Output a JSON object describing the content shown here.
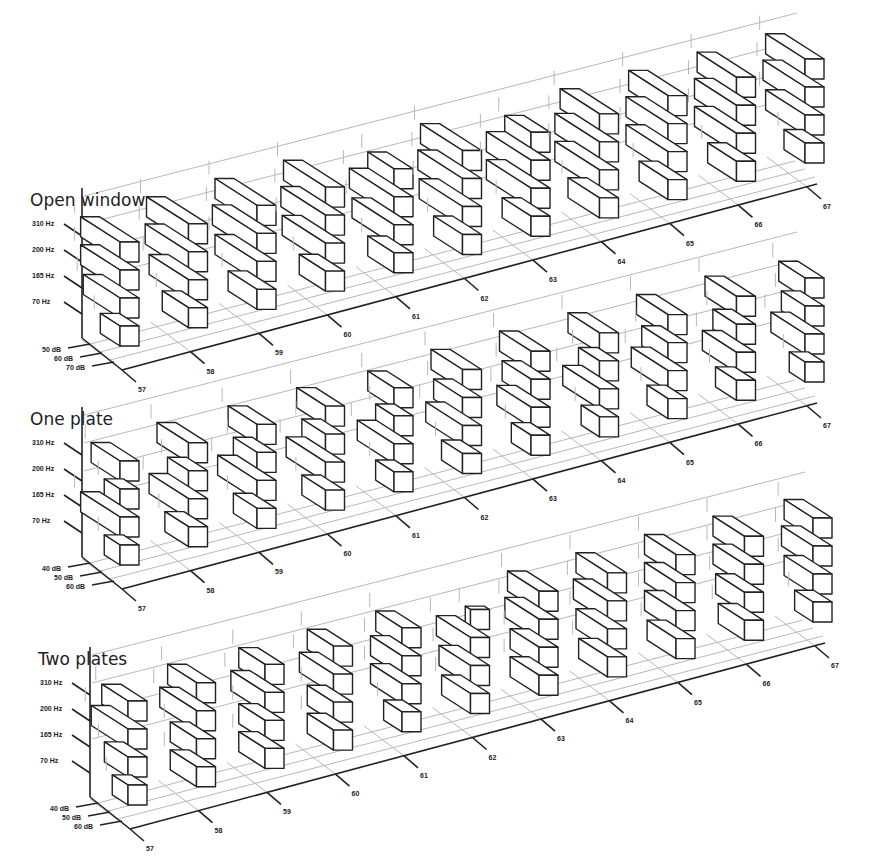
{
  "chart_data": [
    {
      "type": "bar3d",
      "title": "Open window",
      "categories": [
        "57",
        "58",
        "59",
        "60",
        "61",
        "62",
        "63",
        "64",
        "65",
        "66",
        "67"
      ],
      "frequencies": [
        "70 Hz",
        "165 Hz",
        "200 Hz",
        "310 Hz"
      ],
      "depth_axis_labels": [
        "50 dB",
        "60 dB",
        "70 dB"
      ],
      "series": [
        {
          "name": "70 Hz",
          "values": [
            45,
            50,
            52,
            50,
            50,
            52,
            52,
            54,
            52,
            52,
            46
          ]
        },
        {
          "name": "165 Hz",
          "values": [
            58,
            60,
            62,
            63,
            62,
            63,
            64,
            64,
            62,
            62,
            60
          ]
        },
        {
          "name": "200 Hz",
          "values": [
            60,
            63,
            64,
            64,
            64,
            64,
            64,
            64,
            62,
            62,
            62
          ]
        },
        {
          "name": "310 Hz",
          "values": [
            60,
            62,
            62,
            62,
            50,
            62,
            50,
            60,
            60,
            60,
            60
          ]
        }
      ]
    },
    {
      "type": "bar3d",
      "title": "One plate",
      "categories": [
        "57",
        "58",
        "59",
        "60",
        "61",
        "62",
        "63",
        "64",
        "65",
        "66",
        "67"
      ],
      "frequencies": [
        "70 Hz",
        "165 Hz",
        "200 Hz",
        "310 Hz"
      ],
      "depth_axis_labels": [
        "40 dB",
        "50 dB",
        "60 dB"
      ],
      "series": [
        {
          "name": "70 Hz",
          "values": [
            42,
            48,
            48,
            48,
            44,
            46,
            45,
            44,
            46,
            46,
            42
          ]
        },
        {
          "name": "165 Hz",
          "values": [
            60,
            60,
            60,
            60,
            58,
            58,
            56,
            58,
            58,
            56,
            56
          ]
        },
        {
          "name": "200 Hz",
          "values": [
            42,
            46,
            48,
            48,
            44,
            52,
            52,
            46,
            50,
            48,
            48
          ]
        },
        {
          "name": "310 Hz",
          "values": [
            52,
            54,
            52,
            52,
            50,
            54,
            54,
            54,
            54,
            54,
            50
          ]
        }
      ]
    },
    {
      "type": "bar3d",
      "title": "Two plates",
      "categories": [
        "57",
        "58",
        "59",
        "60",
        "61",
        "62",
        "63",
        "64",
        "65",
        "66",
        "67"
      ],
      "frequencies": [
        "70 Hz",
        "165 Hz",
        "200 Hz",
        "310 Hz"
      ],
      "depth_axis_labels": [
        "40 dB",
        "50 dB",
        "60 dB"
      ],
      "series": [
        {
          "name": "70 Hz",
          "values": [
            42,
            50,
            50,
            50,
            44,
            52,
            52,
            52,
            52,
            50,
            44
          ]
        },
        {
          "name": "165 Hz",
          "values": [
            48,
            50,
            50,
            50,
            54,
            54,
            52,
            54,
            54,
            52,
            52
          ]
        },
        {
          "name": "200 Hz",
          "values": [
            58,
            58,
            56,
            56,
            54,
            56,
            56,
            56,
            54,
            54,
            54
          ]
        },
        {
          "name": "310 Hz",
          "values": [
            50,
            52,
            50,
            50,
            50,
            30,
            54,
            54,
            54,
            54,
            52
          ]
        }
      ]
    }
  ],
  "panels": [
    {
      "title": "Open window",
      "origin": [
        82,
        338
      ]
    },
    {
      "title": "One plate",
      "origin": [
        82,
        557
      ]
    },
    {
      "title": "Two plates",
      "origin": [
        90,
        797
      ]
    }
  ]
}
